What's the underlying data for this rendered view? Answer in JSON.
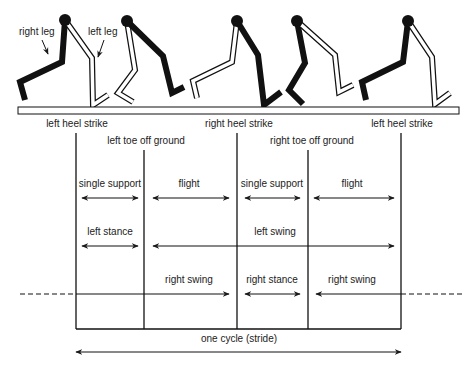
{
  "figure_labels": {
    "right_leg": "right leg",
    "left_leg": "left leg"
  },
  "events": {
    "left_heel_strike_1": "left heel strike",
    "right_heel_strike": "right heel strike",
    "left_heel_strike_2": "left heel strike",
    "left_toe_off": "left toe off ground",
    "right_toe_off": "right toe off ground"
  },
  "phases": {
    "row1": [
      "single support",
      "flight",
      "single support",
      "flight"
    ],
    "row2": [
      "left stance",
      "left swing"
    ],
    "row3": [
      "right swing",
      "right stance",
      "right swing"
    ]
  },
  "stride_label": "one cycle (stride)",
  "colors": {
    "line": "#1a1a1a",
    "text": "#222222",
    "white_leg_fill": "#ffffff"
  }
}
